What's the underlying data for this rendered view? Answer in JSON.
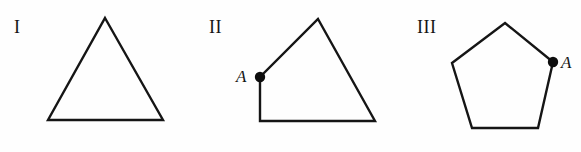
{
  "panel": {
    "width": 581,
    "height": 152,
    "background_color": "#fefefe",
    "stroke_color": "#151515",
    "stroke_width": 2.4,
    "dot_color": "#0d0d0d"
  },
  "figures": [
    {
      "id": "figure-i",
      "label": "I",
      "shape": "triangle",
      "sides": 3,
      "label_position": {
        "x": 14,
        "y": 33
      },
      "vertices": [
        {
          "x": 105,
          "y": 18
        },
        {
          "x": 163,
          "y": 120
        },
        {
          "x": 48,
          "y": 120
        }
      ],
      "marked_point": null
    },
    {
      "id": "figure-ii",
      "label": "II",
      "shape": "quadrilateral",
      "sides": 4,
      "label_position": {
        "x": 209,
        "y": 33
      },
      "vertices": [
        {
          "x": 318,
          "y": 19
        },
        {
          "x": 375,
          "y": 121
        },
        {
          "x": 260,
          "y": 121
        },
        {
          "x": 260,
          "y": 77
        }
      ],
      "marked_point": {
        "label": "A",
        "x": 260,
        "y": 77,
        "radius": 5.2,
        "label_position": {
          "x": 236,
          "y": 82
        }
      }
    },
    {
      "id": "figure-iii",
      "label": "III",
      "shape": "pentagon",
      "sides": 5,
      "label_position": {
        "x": 417,
        "y": 33
      },
      "vertices": [
        {
          "x": 505,
          "y": 23
        },
        {
          "x": 553,
          "y": 62
        },
        {
          "x": 538,
          "y": 128
        },
        {
          "x": 472,
          "y": 128
        },
        {
          "x": 452,
          "y": 63
        }
      ],
      "marked_point": {
        "label": "A",
        "x": 553,
        "y": 62,
        "radius": 5.2,
        "label_position": {
          "x": 561,
          "y": 68
        }
      }
    }
  ]
}
